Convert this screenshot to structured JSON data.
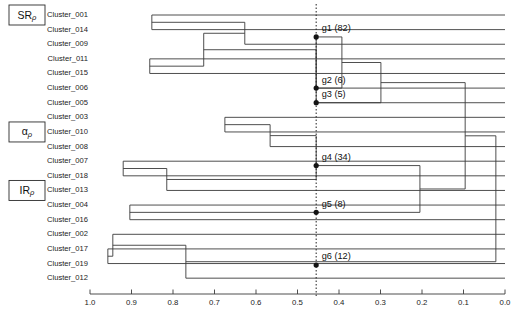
{
  "figure": {
    "type": "dendrogram",
    "orientation": "horizontal-right-to-left",
    "background": "#ffffff",
    "line_color": "#3b3b3b"
  },
  "axis": {
    "label": "",
    "ticks": [
      "1.0",
      "0.9",
      "0.8",
      "0.7",
      "0.6",
      "0.5",
      "0.4",
      "0.3",
      "0.2",
      "0.1",
      "0.0"
    ],
    "tick_values": [
      1.0,
      0.9,
      0.8,
      0.7,
      0.6,
      0.5,
      0.4,
      0.3,
      0.2,
      0.1,
      0.0
    ],
    "min": 0.0,
    "max": 1.0,
    "direction": "descending"
  },
  "cut": {
    "value": 0.455,
    "style": "dotted",
    "color": "#2b2b2b"
  },
  "leaves": [
    {
      "label": "Cluster_001",
      "order": 0
    },
    {
      "label": "Cluster_014",
      "order": 1
    },
    {
      "label": "Cluster_009",
      "order": 2
    },
    {
      "label": "Cluster_011",
      "order": 3
    },
    {
      "label": "Cluster_015",
      "order": 4
    },
    {
      "label": "Cluster_006",
      "order": 5
    },
    {
      "label": "Cluster_005",
      "order": 6
    },
    {
      "label": "Cluster_003",
      "order": 7
    },
    {
      "label": "Cluster_010",
      "order": 8
    },
    {
      "label": "Cluster_008",
      "order": 9
    },
    {
      "label": "Cluster_007",
      "order": 10
    },
    {
      "label": "Cluster_018",
      "order": 11
    },
    {
      "label": "Cluster_013",
      "order": 12
    },
    {
      "label": "Cluster_004",
      "order": 13
    },
    {
      "label": "Cluster_016",
      "order": 14
    },
    {
      "label": "Cluster_002",
      "order": 15
    },
    {
      "label": "Cluster_017",
      "order": 16
    },
    {
      "label": "Cluster_019",
      "order": 17
    },
    {
      "label": "Cluster_012",
      "order": 18
    }
  ],
  "groups": [
    {
      "id": "g1",
      "label": "g1 (82)",
      "count": 82,
      "leaf_index": 1.5
    },
    {
      "id": "g2",
      "label": "g2 (6)",
      "count": 6,
      "leaf_index": 5.0
    },
    {
      "id": "g3",
      "label": "g3 (5)",
      "count": 5,
      "leaf_index": 6.0
    },
    {
      "id": "g4",
      "label": "g4 (34)",
      "count": 34,
      "leaf_index": 10.3
    },
    {
      "id": "g5",
      "label": "g5 (8)",
      "count": 8,
      "leaf_index": 13.5
    },
    {
      "id": "g6",
      "label": "g6 (12)",
      "count": 12,
      "leaf_index": 17.1
    }
  ],
  "side_labels": [
    {
      "id": "SRp",
      "main": "SR",
      "sub": "ρ",
      "leaf_index": 0
    },
    {
      "id": "ap",
      "main": "α",
      "sub": "ρ",
      "leaf_index": 8
    },
    {
      "id": "IRp",
      "main": "IR",
      "sub": "ρ",
      "leaf_index": 12
    }
  ],
  "chart_data": {
    "type": "dendrogram",
    "title": "",
    "xlabel": "",
    "ylabel": "",
    "xlim": [
      1.0,
      0.0
    ],
    "grid": false,
    "legend": "none",
    "leaf_order": [
      "Cluster_001",
      "Cluster_014",
      "Cluster_009",
      "Cluster_011",
      "Cluster_015",
      "Cluster_006",
      "Cluster_005",
      "Cluster_003",
      "Cluster_010",
      "Cluster_008",
      "Cluster_007",
      "Cluster_018",
      "Cluster_013",
      "Cluster_004",
      "Cluster_016",
      "Cluster_002",
      "Cluster_017",
      "Cluster_019",
      "Cluster_012"
    ],
    "merges": [
      {
        "id": "m1",
        "left": "Cluster_001",
        "right": "Cluster_014",
        "height": 0.851
      },
      {
        "id": "m2",
        "left": "Cluster_011",
        "right": "Cluster_015",
        "height": 0.856
      },
      {
        "id": "m3",
        "left": "m1",
        "right": "Cluster_009",
        "height": 0.627
      },
      {
        "id": "m4",
        "left": "m3",
        "right": "m2",
        "height": 0.726
      },
      {
        "id": "m5",
        "left": "m4",
        "right": "Cluster_006",
        "height": 0.455,
        "group": "g1"
      },
      {
        "id": "m6",
        "left": "Cluster_005",
        "right": "m5",
        "height": 0.455,
        "group": "g2"
      },
      {
        "id": "m7",
        "left": "Cluster_003",
        "right": "Cluster_010",
        "height": 0.675
      },
      {
        "id": "m8",
        "left": "m7",
        "right": "Cluster_008",
        "height": 0.566
      },
      {
        "id": "m9",
        "left": "Cluster_007",
        "right": "Cluster_018",
        "height": 0.92
      },
      {
        "id": "m10",
        "left": "m9",
        "right": "Cluster_013",
        "height": 0.815
      },
      {
        "id": "m11",
        "left": "m8",
        "right": "m10",
        "height": 0.455,
        "group": "g4"
      },
      {
        "id": "m12",
        "left": "Cluster_004",
        "right": "Cluster_016",
        "height": 0.904
      },
      {
        "id": "m13",
        "left": "Cluster_017",
        "right": "Cluster_019",
        "height": 0.957
      },
      {
        "id": "m14",
        "left": "Cluster_002",
        "right": "m13",
        "height": 0.945
      },
      {
        "id": "m15",
        "left": "m14",
        "right": "Cluster_012",
        "height": 0.769
      },
      {
        "id": "m16",
        "left": "m5",
        "right": "m6",
        "height": 0.393
      },
      {
        "id": "m17",
        "left": "m16",
        "right": "g3",
        "height": 0.299
      },
      {
        "id": "m18",
        "left": "m11",
        "right": "m12",
        "height": 0.205
      },
      {
        "id": "m19",
        "left": "m17",
        "right": "m18",
        "height": 0.096
      },
      {
        "id": "m20",
        "left": "m19",
        "right": "m15",
        "height": 0.022
      }
    ],
    "group_cut_heights": {
      "g1": 0.455,
      "g2": 0.455,
      "g3": 0.455,
      "g4": 0.455,
      "g5": 0.455,
      "g6": 0.455
    },
    "group_sizes": {
      "g1": 82,
      "g2": 6,
      "g3": 5,
      "g4": 34,
      "g5": 8,
      "g6": 12
    }
  }
}
